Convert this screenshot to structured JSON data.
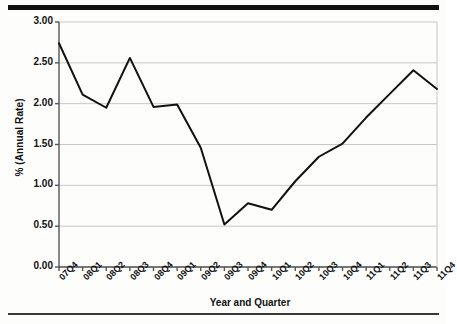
{
  "figure": {
    "top_rule": "",
    "bottom_rule": ""
  },
  "chart_data": {
    "type": "line",
    "title": "",
    "xlabel": "Year and Quarter",
    "ylabel": "% (Annual Rate)",
    "categories": [
      "07Q4",
      "08Q1",
      "08Q2",
      "08Q3",
      "08Q4",
      "09Q1",
      "09Q2",
      "09Q3",
      "09Q4",
      "10Q1",
      "10Q2",
      "10Q3",
      "10Q4",
      "11Q1",
      "11Q2",
      "11Q3",
      "11Q4"
    ],
    "values": [
      2.74,
      2.11,
      1.95,
      2.56,
      1.96,
      1.99,
      1.46,
      0.52,
      0.78,
      0.7,
      1.05,
      1.35,
      1.51,
      1.83,
      2.12,
      2.41,
      2.18
    ],
    "ylim": [
      0.0,
      3.0
    ],
    "ytick_values": [
      0.0,
      0.5,
      1.0,
      1.5,
      2.0,
      2.5,
      3.0
    ],
    "ytick_labels": [
      "0.00",
      "0.50",
      "1.00",
      "1.50",
      "2.00",
      "2.50",
      "3.00"
    ],
    "grid": "horizontal",
    "grid_color": "#c8c8c8",
    "line_color": "#111111",
    "line_width": 2,
    "legend": "none",
    "markers": "none",
    "axis_color": "#555555",
    "plot_background": "#ffffff"
  }
}
